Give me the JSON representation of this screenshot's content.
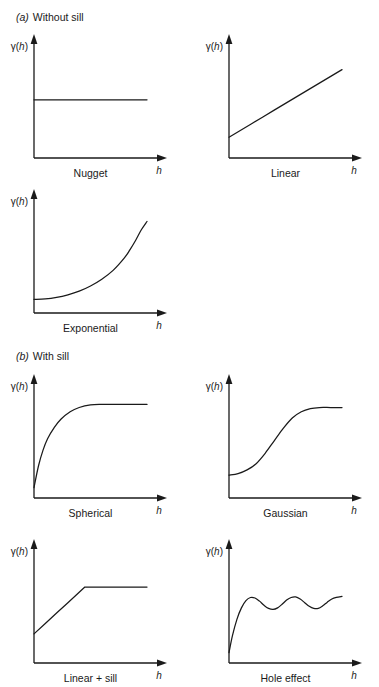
{
  "figure": {
    "axis_y_label_gamma": "γ(",
    "axis_y_label_h": "h",
    "axis_y_label_close": ")",
    "axis_x_label": "h",
    "line_color": "#1a1a1a",
    "background_color": "#ffffff"
  },
  "groups": [
    {
      "enumerator": "(a)",
      "label": "Without sill",
      "panels": [
        "nugget",
        "linear",
        "exponential"
      ]
    },
    {
      "enumerator": "(b)",
      "label": "With sill",
      "panels": [
        "spherical",
        "gaussian",
        "linear_sill",
        "hole_effect"
      ]
    }
  ],
  "chart_data": {
    "type": "line",
    "xlabel": "h",
    "ylabel": "γ(h)",
    "xlim": [
      0,
      1
    ],
    "ylim": [
      0,
      1
    ],
    "grid": false,
    "legend": "none",
    "panels": [
      {
        "id": "nugget",
        "caption": "Nugget",
        "group": "(a) Without sill",
        "description": "Constant value for all lags greater than zero",
        "x": [
          0.0,
          0.1,
          0.2,
          0.3,
          0.4,
          0.5,
          0.6,
          0.7,
          0.8,
          0.9,
          1.0
        ],
        "y": [
          0.56,
          0.56,
          0.56,
          0.56,
          0.56,
          0.56,
          0.56,
          0.56,
          0.56,
          0.56,
          0.56
        ]
      },
      {
        "id": "linear",
        "caption": "Linear",
        "group": "(a) Without sill",
        "description": "Straight line rising from a nugget with no sill",
        "x": [
          0.0,
          0.1,
          0.2,
          0.3,
          0.4,
          0.5,
          0.6,
          0.7,
          0.8,
          0.9,
          1.0
        ],
        "y": [
          0.2,
          0.265,
          0.33,
          0.395,
          0.46,
          0.525,
          0.59,
          0.655,
          0.72,
          0.785,
          0.85
        ]
      },
      {
        "id": "exponential",
        "caption": "Exponential",
        "group": "(a) Without sill",
        "description": "Slow rise that steepens without reaching a sill",
        "x": [
          0.0,
          0.1,
          0.2,
          0.3,
          0.4,
          0.5,
          0.6,
          0.7,
          0.8,
          0.85,
          0.9,
          0.95,
          1.0
        ],
        "y": [
          0.13,
          0.135,
          0.15,
          0.175,
          0.21,
          0.26,
          0.325,
          0.41,
          0.53,
          0.61,
          0.7,
          0.8,
          0.88
        ]
      },
      {
        "id": "spherical",
        "caption": "Spherical",
        "group": "(b) With sill",
        "description": "Steep initial rise from nugget flattening to a sill",
        "x": [
          0.0,
          0.04,
          0.08,
          0.12,
          0.18,
          0.24,
          0.32,
          0.4,
          0.5,
          0.6,
          0.7,
          0.8,
          0.9,
          1.0
        ],
        "y": [
          0.1,
          0.31,
          0.46,
          0.57,
          0.68,
          0.76,
          0.83,
          0.87,
          0.895,
          0.9,
          0.9,
          0.9,
          0.9,
          0.9
        ]
      },
      {
        "id": "gaussian",
        "caption": "Gaussian",
        "group": "(b) With sill",
        "description": "S-shaped curve with parabolic start reaching a sill",
        "x": [
          0.0,
          0.08,
          0.16,
          0.24,
          0.32,
          0.4,
          0.48,
          0.56,
          0.64,
          0.72,
          0.8,
          0.9,
          1.0
        ],
        "y": [
          0.22,
          0.235,
          0.27,
          0.33,
          0.43,
          0.55,
          0.67,
          0.77,
          0.83,
          0.86,
          0.87,
          0.87,
          0.87
        ]
      },
      {
        "id": "linear_sill",
        "caption": "Linear + sill",
        "group": "(b) With sill",
        "description": "Linear rise from nugget to a range then constant sill",
        "x": [
          0.0,
          0.1,
          0.2,
          0.3,
          0.4,
          0.45,
          0.5,
          0.6,
          0.7,
          0.8,
          0.9,
          1.0
        ],
        "y": [
          0.28,
          0.38,
          0.48,
          0.58,
          0.68,
          0.73,
          0.73,
          0.73,
          0.73,
          0.73,
          0.73,
          0.73
        ]
      },
      {
        "id": "hole_effect",
        "caption": "Hole effect",
        "group": "(b) With sill",
        "description": "Damped oscillation about the sill with repeating peaks and troughs",
        "x": [
          0.0,
          0.03,
          0.07,
          0.11,
          0.15,
          0.19,
          0.23,
          0.27,
          0.31,
          0.35,
          0.39,
          0.43,
          0.47,
          0.51,
          0.55,
          0.59,
          0.63,
          0.67,
          0.71,
          0.75,
          0.79,
          0.83,
          0.87,
          0.91,
          0.95,
          1.0
        ],
        "y": [
          0.1,
          0.26,
          0.42,
          0.53,
          0.6,
          0.63,
          0.625,
          0.595,
          0.555,
          0.525,
          0.515,
          0.53,
          0.565,
          0.605,
          0.63,
          0.635,
          0.615,
          0.58,
          0.545,
          0.525,
          0.525,
          0.55,
          0.585,
          0.615,
          0.63,
          0.64
        ]
      }
    ]
  }
}
